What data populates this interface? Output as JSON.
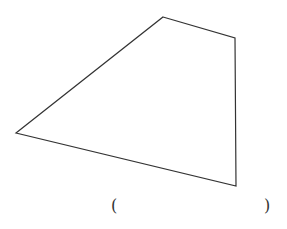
{
  "figure": {
    "shape": "quadrilateral",
    "stroke_color": "#333333",
    "vertices": [
      [
        163,
        17
      ],
      [
        235,
        38
      ],
      [
        236,
        186
      ],
      [
        16,
        133
      ]
    ]
  },
  "answer": {
    "open_paren": "(",
    "close_paren": ")",
    "value": ""
  }
}
